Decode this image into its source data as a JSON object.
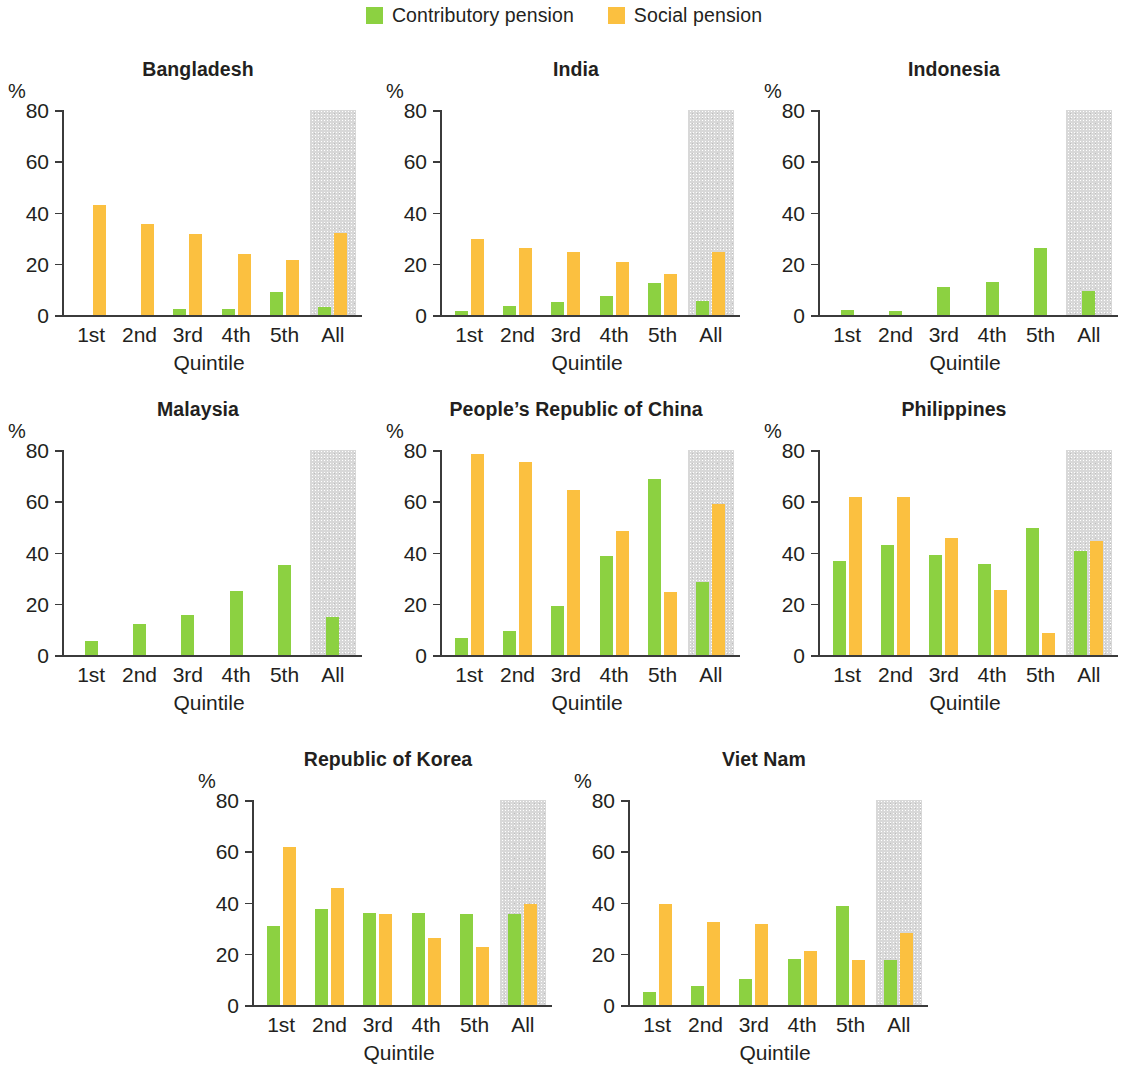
{
  "legend": {
    "items": [
      {
        "label": "Contributory pension",
        "color": "#8CD141",
        "key": "contributory"
      },
      {
        "label": "Social pension",
        "color": "#FBC040",
        "key": "social"
      }
    ]
  },
  "axis": {
    "y_unit": "%",
    "y_ticks": [
      "80",
      "60",
      "40",
      "20",
      "0"
    ],
    "x_title": "Quintile",
    "x_categories": [
      "1st",
      "2nd",
      "3rd",
      "4th",
      "5th",
      "All"
    ]
  },
  "colors": {
    "contributory": "#8CD141",
    "social": "#FBC040",
    "all_band": "#d8d8d8",
    "axis": "#3b3b3b",
    "text": "#231f20"
  },
  "chart_data": [
    {
      "type": "bar",
      "title": "Bangladesh",
      "xlabel": "Quintile",
      "ylabel": "%",
      "ylim": [
        0,
        80
      ],
      "grid": false,
      "legend_position": "top-center",
      "categories": [
        "1st",
        "2nd",
        "3rd",
        "4th",
        "5th",
        "All"
      ],
      "series": [
        {
          "name": "Contributory pension",
          "values": [
            0,
            0,
            2.5,
            2.5,
            9,
            3
          ]
        },
        {
          "name": "Social pension",
          "values": [
            43,
            35.5,
            31.5,
            24,
            21.5,
            32
          ]
        }
      ]
    },
    {
      "type": "bar",
      "title": "India",
      "xlabel": "Quintile",
      "ylabel": "%",
      "ylim": [
        0,
        80
      ],
      "grid": false,
      "legend_position": "top-center",
      "categories": [
        "1st",
        "2nd",
        "3rd",
        "4th",
        "5th",
        "All"
      ],
      "series": [
        {
          "name": "Contributory pension",
          "values": [
            1.5,
            3.5,
            5,
            7.5,
            12.5,
            5.5
          ]
        },
        {
          "name": "Social pension",
          "values": [
            29.5,
            26,
            24.5,
            20.5,
            16,
            24.5
          ]
        }
      ]
    },
    {
      "type": "bar",
      "title": "Indonesia",
      "xlabel": "Quintile",
      "ylabel": "%",
      "ylim": [
        0,
        80
      ],
      "grid": false,
      "legend_position": "top-center",
      "categories": [
        "1st",
        "2nd",
        "3rd",
        "4th",
        "5th",
        "All"
      ],
      "series": [
        {
          "name": "Contributory pension",
          "values": [
            2,
            1.5,
            11,
            13,
            26,
            9.5
          ]
        },
        {
          "name": "Social pension",
          "values": [
            0,
            0,
            0,
            0,
            0,
            0
          ]
        }
      ]
    },
    {
      "type": "bar",
      "title": "Malaysia",
      "xlabel": "Quintile",
      "ylabel": "%",
      "ylim": [
        0,
        80
      ],
      "grid": false,
      "legend_position": "top-center",
      "categories": [
        "1st",
        "2nd",
        "3rd",
        "4th",
        "5th",
        "All"
      ],
      "series": [
        {
          "name": "Contributory pension",
          "values": [
            5.5,
            12,
            15.5,
            25,
            35,
            15
          ]
        },
        {
          "name": "Social pension",
          "values": [
            0,
            0,
            0,
            0,
            0,
            0
          ]
        }
      ]
    },
    {
      "type": "bar",
      "title": "People’s Republic of China",
      "xlabel": "Quintile",
      "ylabel": "%",
      "ylim": [
        0,
        80
      ],
      "grid": false,
      "legend_position": "top-center",
      "categories": [
        "1st",
        "2nd",
        "3rd",
        "4th",
        "5th",
        "All"
      ],
      "series": [
        {
          "name": "Contributory pension",
          "values": [
            6.5,
            9.5,
            19,
            38.5,
            68.5,
            28.5
          ]
        },
        {
          "name": "Social pension",
          "values": [
            78.5,
            75.5,
            64.5,
            48.5,
            24.5,
            59
          ]
        }
      ]
    },
    {
      "type": "bar",
      "title": "Philippines",
      "xlabel": "Quintile",
      "ylabel": "%",
      "ylim": [
        0,
        80
      ],
      "grid": false,
      "legend_position": "top-center",
      "categories": [
        "1st",
        "2nd",
        "3rd",
        "4th",
        "5th",
        "All"
      ],
      "series": [
        {
          "name": "Contributory pension",
          "values": [
            36.5,
            43,
            39,
            35.5,
            49.5,
            40.5
          ]
        },
        {
          "name": "Social pension",
          "values": [
            61.5,
            61.5,
            45.5,
            25.5,
            8.5,
            44.5
          ]
        }
      ]
    },
    {
      "type": "bar",
      "title": "Republic of Korea",
      "xlabel": "Quintile",
      "ylabel": "%",
      "ylim": [
        0,
        80
      ],
      "grid": false,
      "legend_position": "top-center",
      "categories": [
        "1st",
        "2nd",
        "3rd",
        "4th",
        "5th",
        "All"
      ],
      "series": [
        {
          "name": "Contributory pension",
          "values": [
            31,
            37.5,
            36,
            36,
            35.5,
            35.5
          ]
        },
        {
          "name": "Social pension",
          "values": [
            61.5,
            45.5,
            35.5,
            26,
            22.5,
            39.5
          ]
        }
      ]
    },
    {
      "type": "bar",
      "title": "Viet Nam",
      "xlabel": "Quintile",
      "ylabel": "%",
      "ylim": [
        0,
        80
      ],
      "grid": false,
      "legend_position": "top-center",
      "categories": [
        "1st",
        "2nd",
        "3rd",
        "4th",
        "5th",
        "All"
      ],
      "series": [
        {
          "name": "Contributory pension",
          "values": [
            5,
            7.5,
            10,
            18,
            38.5,
            17.5
          ]
        },
        {
          "name": "Social pension",
          "values": [
            39.5,
            32.5,
            31.5,
            21,
            17.5,
            28
          ]
        }
      ]
    }
  ],
  "layout": {
    "panels": [
      {
        "index": 0,
        "left": 0,
        "top": 58,
        "width": 378,
        "height": 330
      },
      {
        "index": 1,
        "left": 378,
        "top": 58,
        "width": 378,
        "height": 330
      },
      {
        "index": 2,
        "left": 756,
        "top": 58,
        "width": 378,
        "height": 330
      },
      {
        "index": 3,
        "left": 0,
        "top": 398,
        "width": 378,
        "height": 330
      },
      {
        "index": 4,
        "left": 378,
        "top": 398,
        "width": 378,
        "height": 330
      },
      {
        "index": 5,
        "left": 756,
        "top": 398,
        "width": 378,
        "height": 330
      },
      {
        "index": 6,
        "left": 190,
        "top": 748,
        "width": 378,
        "height": 330
      },
      {
        "index": 7,
        "left": 566,
        "top": 748,
        "width": 378,
        "height": 330
      }
    ]
  }
}
